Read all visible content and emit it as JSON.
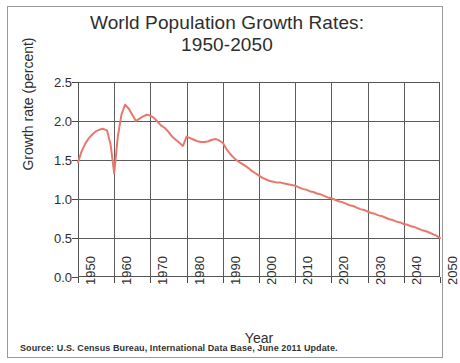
{
  "title": {
    "line1": "World Population Growth Rates:",
    "line2": "1950-2050"
  },
  "source": "Source: U.S. Census Bureau, International Data Base, June 2011 Update.",
  "chart_data": {
    "type": "line",
    "title": "World Population Growth Rates: 1950-2050",
    "xlabel": "Year",
    "ylabel": "Growth rate (percent)",
    "xlim": [
      1950,
      2050
    ],
    "ylim": [
      0.0,
      2.5
    ],
    "xticks": [
      1950,
      1960,
      1970,
      1980,
      1990,
      2000,
      2010,
      2020,
      2030,
      2040,
      2050
    ],
    "xtick_labels": [
      "1950",
      "1960",
      "1970",
      "1980",
      "1990",
      "2000",
      "2010",
      "2020",
      "2030",
      "2040",
      "2050"
    ],
    "yticks": [
      0.0,
      0.5,
      1.0,
      1.5,
      2.0,
      2.5
    ],
    "ytick_labels": [
      "0.0",
      "0.5",
      "1.0",
      "1.5",
      "2.0",
      "2.5"
    ],
    "grid": true,
    "legend": null,
    "line_color": "#e8786c",
    "line_width": 2.0,
    "x": [
      1950,
      1951,
      1952,
      1953,
      1954,
      1955,
      1956,
      1957,
      1958,
      1959,
      1960,
      1961,
      1962,
      1963,
      1964,
      1965,
      1966,
      1967,
      1968,
      1969,
      1970,
      1971,
      1972,
      1973,
      1974,
      1975,
      1976,
      1977,
      1978,
      1979,
      1980,
      1981,
      1982,
      1983,
      1984,
      1985,
      1986,
      1987,
      1988,
      1989,
      1990,
      1991,
      1992,
      1993,
      1994,
      1995,
      1996,
      1997,
      1998,
      1999,
      2000,
      2001,
      2002,
      2003,
      2004,
      2005,
      2006,
      2007,
      2008,
      2009,
      2010,
      2011,
      2012,
      2013,
      2014,
      2015,
      2016,
      2017,
      2018,
      2019,
      2020,
      2021,
      2022,
      2023,
      2024,
      2025,
      2026,
      2027,
      2028,
      2029,
      2030,
      2031,
      2032,
      2033,
      2034,
      2035,
      2036,
      2037,
      2038,
      2039,
      2040,
      2041,
      2042,
      2043,
      2044,
      2045,
      2046,
      2047,
      2048,
      2049,
      2050
    ],
    "values": [
      1.47,
      1.61,
      1.71,
      1.78,
      1.83,
      1.87,
      1.89,
      1.9,
      1.88,
      1.7,
      1.33,
      1.8,
      2.08,
      2.21,
      2.16,
      2.08,
      2.0,
      2.03,
      2.06,
      2.08,
      2.07,
      2.04,
      1.99,
      1.94,
      1.91,
      1.86,
      1.8,
      1.76,
      1.72,
      1.68,
      1.8,
      1.78,
      1.76,
      1.74,
      1.73,
      1.73,
      1.74,
      1.76,
      1.77,
      1.75,
      1.72,
      1.64,
      1.58,
      1.53,
      1.49,
      1.46,
      1.43,
      1.4,
      1.36,
      1.33,
      1.3,
      1.27,
      1.25,
      1.23,
      1.22,
      1.21,
      1.21,
      1.2,
      1.19,
      1.18,
      1.17,
      1.15,
      1.13,
      1.12,
      1.1,
      1.09,
      1.07,
      1.06,
      1.04,
      1.02,
      1.01,
      0.99,
      0.97,
      0.96,
      0.94,
      0.92,
      0.91,
      0.89,
      0.87,
      0.86,
      0.84,
      0.82,
      0.81,
      0.79,
      0.78,
      0.76,
      0.74,
      0.73,
      0.71,
      0.7,
      0.68,
      0.67,
      0.65,
      0.64,
      0.62,
      0.6,
      0.59,
      0.57,
      0.55,
      0.53,
      0.5
    ]
  }
}
